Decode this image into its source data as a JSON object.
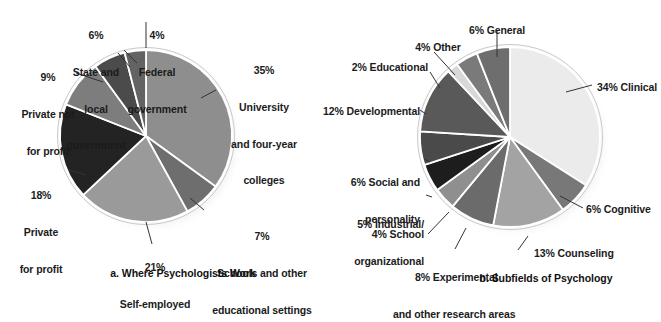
{
  "figure": {
    "background": "#ffffff",
    "text_color": "#1b1b1b",
    "leader_color": "#333333"
  },
  "chart_data": [
    {
      "type": "pie",
      "id": "where-psychologists-work",
      "title": "a. Where Psychologists Work",
      "caption": "a. Where Psychologists Work",
      "center": [
        146,
        136
      ],
      "radius": 86,
      "start_angle": -90,
      "direction": "clockwise",
      "slices": [
        {
          "label": "University and four-year colleges",
          "pct_text": "35%",
          "value": 35,
          "color": "#8e8e8e"
        },
        {
          "label": "Schools and other educational settings",
          "pct_text": "7%",
          "value": 7,
          "color": "#6e6e6e"
        },
        {
          "label": "Self-employed",
          "pct_text": "21%",
          "value": 21,
          "color": "#9a9a9a"
        },
        {
          "label": "Private for profit",
          "pct_text": "18%",
          "value": 18,
          "color": "#232323"
        },
        {
          "label": "Private not for profit",
          "pct_text": "9%",
          "value": 9,
          "color": "#7d7d7d"
        },
        {
          "label": "State and local government",
          "pct_text": "6%",
          "value": 6,
          "color": "#4b4b4b"
        },
        {
          "label": "Federal government",
          "pct_text": "4%",
          "value": 4,
          "color": "#636363"
        }
      ],
      "labels": [
        {
          "lines": [
            "6%",
            "State and",
            "local",
            "government"
          ],
          "align": "center"
        },
        {
          "lines": [
            "4%",
            "Federal",
            "government"
          ],
          "align": "center"
        },
        {
          "lines": [
            "9%",
            "Private not",
            "for profit"
          ],
          "align": "center"
        },
        {
          "lines": [
            "18%",
            "Private",
            "for profit"
          ],
          "align": "center"
        },
        {
          "lines": [
            "21%",
            "Self-employed"
          ],
          "align": "center"
        },
        {
          "lines": [
            "35%",
            "University",
            "and four-year",
            "colleges"
          ],
          "align": "center"
        },
        {
          "lines": [
            "7%",
            "Schools and other",
            "educational settings"
          ],
          "align": "center"
        }
      ]
    },
    {
      "type": "pie",
      "id": "subfields-of-psychology",
      "title": "b. Subfields of Psychology",
      "caption": "b. Subfields of Psychology",
      "center": [
        510,
        137
      ],
      "radius": 90,
      "start_angle": -90,
      "direction": "clockwise",
      "slices": [
        {
          "label": "Clinical",
          "pct_text": "34%",
          "value": 34,
          "color": "#ebebeb"
        },
        {
          "label": "Cognitive",
          "pct_text": "6%",
          "value": 6,
          "color": "#787878"
        },
        {
          "label": "Counseling",
          "pct_text": "13%",
          "value": 13,
          "color": "#a3a3a3"
        },
        {
          "label": "Experimental and other research areas",
          "pct_text": "8%",
          "value": 8,
          "color": "#6b6b6b"
        },
        {
          "label": "School",
          "pct_text": "4%",
          "value": 4,
          "color": "#8f8f8f"
        },
        {
          "label": "Industrial/organizational",
          "pct_text": "5%",
          "value": 5,
          "color": "#1d1d1d"
        },
        {
          "label": "Social and personality",
          "pct_text": "6%",
          "value": 6,
          "color": "#4a4a4a"
        },
        {
          "label": "Developmental",
          "pct_text": "12%",
          "value": 12,
          "color": "#595959"
        },
        {
          "label": "Educational",
          "pct_text": "2%",
          "value": 2,
          "color": "#d8d8d8"
        },
        {
          "label": "Other",
          "pct_text": "4%",
          "value": 4,
          "color": "#7a7a7a"
        },
        {
          "label": "General",
          "pct_text": "6%",
          "value": 6,
          "color": "#6e6e6e"
        }
      ],
      "labels": [
        {
          "lines": [
            "6% General"
          ],
          "align": "center"
        },
        {
          "lines": [
            "4% Other"
          ],
          "align": "center"
        },
        {
          "lines": [
            "2% Educational"
          ],
          "align": "right"
        },
        {
          "lines": [
            "12% Developmental"
          ],
          "align": "right"
        },
        {
          "lines": [
            "6% Social and",
            "personality"
          ],
          "align": "right"
        },
        {
          "lines": [
            "5% Industrial/",
            "organizational"
          ],
          "align": "right"
        },
        {
          "lines": [
            "4% School"
          ],
          "align": "right"
        },
        {
          "lines": [
            "8% Experimental",
            "and other research areas"
          ],
          "align": "center"
        },
        {
          "lines": [
            "13% Counseling"
          ],
          "align": "left"
        },
        {
          "lines": [
            "6% Cognitive"
          ],
          "align": "left"
        },
        {
          "lines": [
            "34% Clinical"
          ],
          "align": "left"
        }
      ]
    }
  ],
  "left_chart": {
    "caption": "a. Where Psychologists Work",
    "l_state_local_1": "6%",
    "l_state_local_2": "State and",
    "l_state_local_3": "local",
    "l_state_local_4": "government",
    "l_federal_1": "4%",
    "l_federal_2": "Federal",
    "l_federal_3": "government",
    "l_private_not_1": "9%",
    "l_private_not_2": "Private not",
    "l_private_not_3": "for profit",
    "l_private_for_1": "18%",
    "l_private_for_2": "Private",
    "l_private_for_3": "for profit",
    "l_self_1": "21%",
    "l_self_2": "Self-employed",
    "l_univ_1": "35%",
    "l_univ_2": "University",
    "l_univ_3": "and four-year",
    "l_univ_4": "colleges",
    "l_schools_1": "7%",
    "l_schools_2": "Schools and other",
    "l_schools_3": "educational settings"
  },
  "right_chart": {
    "caption": "b. Subfields of Psychology",
    "l_general": "6% General",
    "l_other": "4% Other",
    "l_educational": "2% Educational",
    "l_developmental": "12% Developmental",
    "l_social_1": "6% Social and",
    "l_social_2": "personality",
    "l_io_1": "5% Industrial/",
    "l_io_2": "organizational",
    "l_school": "4% School",
    "l_experimental_1": "8% Experimental",
    "l_experimental_2": "and other research areas",
    "l_counseling": "13% Counseling",
    "l_cognitive": "6% Cognitive",
    "l_clinical": "34% Clinical"
  }
}
